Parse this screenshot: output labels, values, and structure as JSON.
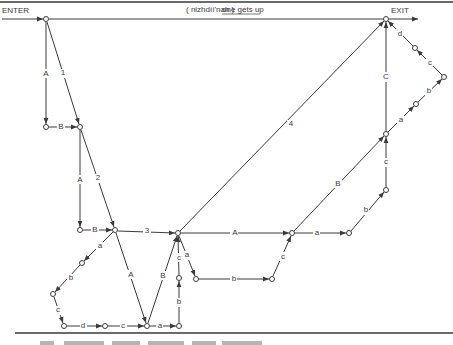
{
  "diagram": {
    "caption": {
      "gloss": "( nizhdíí'nah )",
      "translation": "one gets up"
    },
    "terminals": {
      "enter": "ENTER",
      "exit": "EXIT"
    },
    "figure_caption_partial": "(caption text cut off at bottom edge)",
    "nodes": [
      {
        "id": "enter",
        "x": 46,
        "y": 19
      },
      {
        "id": "exit",
        "x": 386,
        "y": 19
      },
      {
        "id": "n1",
        "x": 46,
        "y": 127
      },
      {
        "id": "n2",
        "x": 80,
        "y": 127
      },
      {
        "id": "n3",
        "x": 80,
        "y": 230
      },
      {
        "id": "n4",
        "x": 115,
        "y": 230
      },
      {
        "id": "hub",
        "x": 178,
        "y": 233
      },
      {
        "id": "n6",
        "x": 292,
        "y": 233
      },
      {
        "id": "n7",
        "x": 349,
        "y": 233
      },
      {
        "id": "n8",
        "x": 386,
        "y": 190
      },
      {
        "id": "n9",
        "x": 386,
        "y": 134
      },
      {
        "id": "n10",
        "x": 416,
        "y": 104
      },
      {
        "id": "n11",
        "x": 444,
        "y": 77
      },
      {
        "id": "n12",
        "x": 415,
        "y": 48
      },
      {
        "id": "n13",
        "x": 196,
        "y": 279
      },
      {
        "id": "n14",
        "x": 272,
        "y": 279
      },
      {
        "id": "n15",
        "x": 82,
        "y": 263
      },
      {
        "id": "n16",
        "x": 53,
        "y": 294
      },
      {
        "id": "n17",
        "x": 64,
        "y": 326
      },
      {
        "id": "n18",
        "x": 105,
        "y": 326
      },
      {
        "id": "n19",
        "x": 147,
        "y": 326
      },
      {
        "id": "n20",
        "x": 179,
        "y": 326
      },
      {
        "id": "n21",
        "x": 179,
        "y": 278
      }
    ],
    "edges": [
      {
        "from": "enter",
        "to": "n1",
        "label": "A"
      },
      {
        "from": "n1",
        "to": "n2",
        "label": "B"
      },
      {
        "from": "enter",
        "to": "n2",
        "label": "1"
      },
      {
        "from": "n2",
        "to": "n3",
        "label": "A"
      },
      {
        "from": "n3",
        "to": "n4",
        "label": "B"
      },
      {
        "from": "n2",
        "to": "n4",
        "label": "2"
      },
      {
        "from": "n4",
        "to": "hub",
        "label": "3"
      },
      {
        "from": "hub",
        "to": "exit",
        "label": "4"
      },
      {
        "from": "hub",
        "to": "n6",
        "label": "A"
      },
      {
        "from": "n6",
        "to": "n9",
        "label": "B"
      },
      {
        "from": "n9",
        "to": "exit",
        "label": "C"
      },
      {
        "from": "n6",
        "to": "n7",
        "label": "a"
      },
      {
        "from": "n7",
        "to": "n8",
        "label": "b"
      },
      {
        "from": "n8",
        "to": "n9",
        "label": "c"
      },
      {
        "from": "n9",
        "to": "n10",
        "label": "a"
      },
      {
        "from": "n10",
        "to": "n11",
        "label": "b"
      },
      {
        "from": "n11",
        "to": "n12",
        "label": "c"
      },
      {
        "from": "n12",
        "to": "exit",
        "label": "d"
      },
      {
        "from": "hub",
        "to": "n13",
        "label": "a"
      },
      {
        "from": "n13",
        "to": "n14",
        "label": "b"
      },
      {
        "from": "n14",
        "to": "n6",
        "label": "c"
      },
      {
        "from": "n4",
        "to": "n15",
        "label": "a"
      },
      {
        "from": "n15",
        "to": "n16",
        "label": "b"
      },
      {
        "from": "n16",
        "to": "n17",
        "label": "c"
      },
      {
        "from": "n17",
        "to": "n18",
        "label": "d"
      },
      {
        "from": "n18",
        "to": "n19",
        "label": "c"
      },
      {
        "from": "n4",
        "to": "n19",
        "label": "A"
      },
      {
        "from": "n19",
        "to": "hub",
        "label": "B"
      },
      {
        "from": "n19",
        "to": "n20",
        "label": "a"
      },
      {
        "from": "n20",
        "to": "n21",
        "label": "b"
      },
      {
        "from": "n21",
        "to": "hub",
        "label": "c"
      }
    ]
  }
}
